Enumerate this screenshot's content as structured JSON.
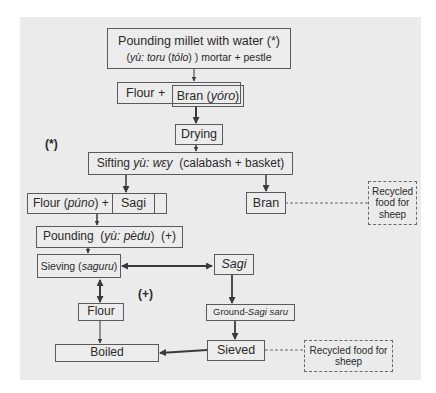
{
  "diagram": {
    "nodes": {
      "pounding_millet": {
        "line1": "Pounding millet with water (*)",
        "line2_pre": "(",
        "line2_italic_a": "yù: toru",
        "line2_mid": " (",
        "line2_italic_b": "tólo",
        "line2_post": ") ) mortar + pestle"
      },
      "flour_plus": {
        "label": "Flour +"
      },
      "bran_yoro": {
        "label": "Bran (",
        "italic": "yóro",
        "suffix": ")"
      },
      "drying": {
        "label": "Drying"
      },
      "sifting": {
        "label": "Sifting ",
        "italic": "yù: wɛy",
        "suffix": "  (calabash + basket)"
      },
      "flour_puno": {
        "label": "Flour (",
        "italic": "púno",
        "suffix": ") +"
      },
      "sagi_inner": {
        "label": "Sagi"
      },
      "bran": {
        "label": "Bran"
      },
      "recycled_1": {
        "label": "Recycled food for sheep"
      },
      "pounding_pedu": {
        "label": "Pounding  (",
        "italic": "yù: pèdu",
        "suffix": ")  (+)"
      },
      "sieving": {
        "label": "Sieving (",
        "italic": "saguru",
        "suffix": ")"
      },
      "sagi": {
        "label": "Sagi"
      },
      "flour": {
        "label": "Flour"
      },
      "ground_sagi": {
        "label": "Ground-",
        "italic": "Sagi saru"
      },
      "boiled": {
        "label": "Boiled"
      },
      "sieved": {
        "label": "Sieved"
      },
      "recycled_2": {
        "label": "Recycled food for sheep"
      }
    },
    "annotations": {
      "star": "(*)",
      "plus": "(+)"
    },
    "colors": {
      "background": "#ebebeb",
      "border": "#5a5a5a",
      "arrow": "#3a3a3a",
      "text": "#2a2a2a"
    }
  }
}
